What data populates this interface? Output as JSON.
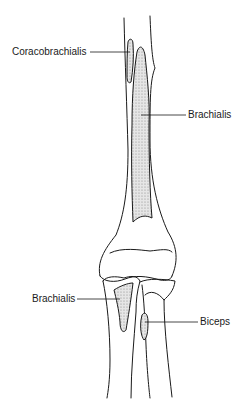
{
  "figure": {
    "colors": {
      "line": "#1a1a1a",
      "shade": "#d9d9d9",
      "background": "#ffffff"
    }
  },
  "labels": [
    {
      "id": "coracobrachialis",
      "text": "Coracobrachialis"
    },
    {
      "id": "brachialis_upper",
      "text": "Brachialis"
    },
    {
      "id": "brachialis_lower",
      "text": "Brachialis"
    },
    {
      "id": "biceps",
      "text": "Biceps"
    }
  ]
}
